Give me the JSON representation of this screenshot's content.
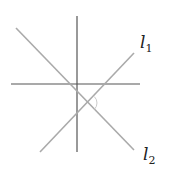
{
  "diagram": {
    "axes": {
      "vertical": {
        "x1": 77,
        "y1": 16,
        "x2": 77,
        "y2": 152,
        "color": "#555555"
      },
      "horizontal": {
        "x1": 11,
        "y1": 84,
        "x2": 140,
        "y2": 84,
        "color": "#555555"
      }
    },
    "lines": [
      {
        "name": "l1",
        "label": "l",
        "subscript": "1",
        "x1": 40,
        "y1": 152,
        "x2": 134,
        "y2": 53,
        "color": "#aaaaaa",
        "label_x": 140,
        "label_y": 48
      },
      {
        "name": "l2",
        "label": "l",
        "subscript": "2",
        "x1": 16,
        "y1": 28,
        "x2": 134,
        "y2": 150,
        "color": "#aaaaaa",
        "label_x": 143,
        "label_y": 160
      }
    ],
    "right_angle_marker": {
      "cx": 88,
      "cy": 103,
      "color": "#cccccc"
    }
  }
}
